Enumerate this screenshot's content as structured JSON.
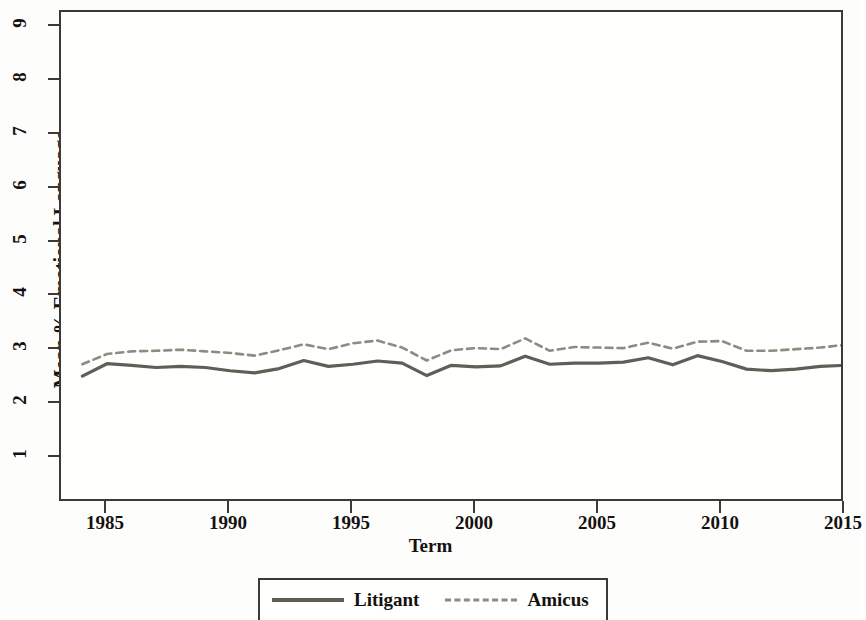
{
  "chart_data": {
    "type": "line",
    "title": "",
    "xlabel": "Term",
    "ylabel": "Mean % Emotional Language",
    "xlim": [
      1983.5,
      2015.5
    ],
    "ylim": [
      0.6,
      9.4
    ],
    "xticks": [
      1985,
      1990,
      1995,
      2000,
      2005,
      2010,
      2015
    ],
    "yticks": [
      1,
      2,
      3,
      4,
      5,
      6,
      7,
      8,
      9
    ],
    "grid": false,
    "legend_position": "bottom",
    "x": [
      1984,
      1985,
      1986,
      1987,
      1988,
      1989,
      1990,
      1991,
      1992,
      1993,
      1994,
      1995,
      1996,
      1997,
      1998,
      1999,
      2000,
      2001,
      2002,
      2003,
      2004,
      2005,
      2006,
      2007,
      2008,
      2009,
      2010,
      2011,
      2012,
      2013,
      2014,
      2015
    ],
    "series": [
      {
        "name": "Litigant",
        "style": "solid",
        "color": "#5f5f55",
        "values": [
          2.52,
          2.75,
          2.72,
          2.68,
          2.7,
          2.68,
          2.62,
          2.58,
          2.66,
          2.81,
          2.7,
          2.74,
          2.8,
          2.76,
          2.53,
          2.72,
          2.69,
          2.71,
          2.89,
          2.74,
          2.76,
          2.76,
          2.78,
          2.86,
          2.73,
          2.9,
          2.79,
          2.65,
          2.62,
          2.65,
          2.7,
          2.72
        ]
      },
      {
        "name": "Amicus",
        "style": "dashed",
        "color": "#8c8c80",
        "values": [
          2.74,
          2.93,
          2.98,
          2.99,
          3.01,
          2.98,
          2.95,
          2.9,
          3.0,
          3.11,
          3.02,
          3.13,
          3.18,
          3.05,
          2.81,
          3.0,
          3.04,
          3.02,
          3.22,
          2.99,
          3.06,
          3.05,
          3.04,
          3.14,
          3.03,
          3.16,
          3.17,
          2.99,
          2.99,
          3.02,
          3.05,
          3.1
        ]
      }
    ]
  },
  "axes": {
    "ytick_labels": [
      "1",
      "2",
      "3",
      "4",
      "5",
      "6",
      "7",
      "8",
      "9"
    ],
    "xtick_labels": [
      "1985",
      "1990",
      "1995",
      "2000",
      "2005",
      "2010",
      "2015"
    ],
    "x_title": "Term",
    "y_title": "Mean % Emotional Language"
  },
  "legend": {
    "entries": [
      {
        "label": "Litigant",
        "style": "solid"
      },
      {
        "label": "Amicus",
        "style": "dashed"
      }
    ]
  },
  "colors": {
    "litigant": "#5f5f55",
    "amicus": "#8c8c80",
    "axis": "#3a3a38",
    "text": "#14110f",
    "background": "#fdfdfc"
  }
}
